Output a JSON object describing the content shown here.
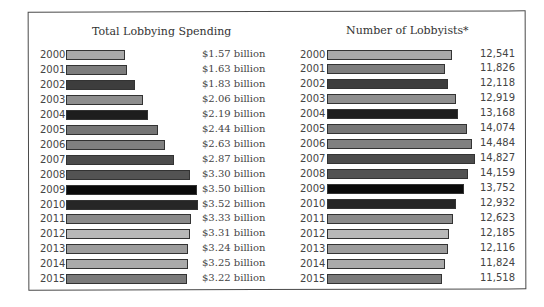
{
  "chart_data": [
    {
      "type": "bar",
      "orientation": "horizontal",
      "title": "Total Lobbying Spending",
      "categories": [
        "2000",
        "2001",
        "2002",
        "2003",
        "2004",
        "2005",
        "2006",
        "2007",
        "2008",
        "2009",
        "2010",
        "2011",
        "2012",
        "2013",
        "2014",
        "2015"
      ],
      "values": [
        1.57,
        1.63,
        1.83,
        2.06,
        2.19,
        2.44,
        2.63,
        2.87,
        3.3,
        3.5,
        3.52,
        3.33,
        3.31,
        3.24,
        3.25,
        3.22
      ],
      "labels": [
        "$1.57 billion",
        "$1.63 billion",
        "$1.83 billion",
        "$2.06 billion",
        "$2.19 billion",
        "$2.44 billion",
        "$2.63 billion",
        "$2.87 billion",
        "$3.30 billion",
        "$3.50 billion",
        "$3.52 billion",
        "$3.33 billion",
        "$3.31 billion",
        "$3.24 billion",
        "$3.25 billion",
        "$3.22 billion"
      ],
      "unit": "billion USD",
      "xlabel": "",
      "ylabel": "",
      "grid": false
    },
    {
      "type": "bar",
      "orientation": "horizontal",
      "title": "Number of Lobbyists*",
      "categories": [
        "2000",
        "2001",
        "2002",
        "2003",
        "2004",
        "2005",
        "2006",
        "2007",
        "2008",
        "2009",
        "2010",
        "2011",
        "2012",
        "2013",
        "2014",
        "2015"
      ],
      "values": [
        12541,
        11826,
        12118,
        12919,
        13168,
        14074,
        14484,
        14827,
        14159,
        13752,
        12932,
        12623,
        12185,
        12116,
        11824,
        11518
      ],
      "labels": [
        "12,541",
        "11,826",
        "12,118",
        "12,919",
        "13,168",
        "14,074",
        "14,484",
        "14,827",
        "14,159",
        "13,752",
        "12,932",
        "12,623",
        "12,185",
        "12,116",
        "11,824",
        "11,518"
      ],
      "xlabel": "",
      "ylabel": "",
      "grid": false
    }
  ],
  "bar_colors": [
    "#a8a8a8",
    "#7d7d7d",
    "#3d3d3d",
    "#8e8e8e",
    "#1e1e1e",
    "#767676",
    "#808080",
    "#4c4c4c",
    "#535353",
    "#0a0a0a",
    "#262626",
    "#8a8a8a",
    "#b8b8b8",
    "#9c9c9c",
    "#aaaaaa",
    "#7a7a7a"
  ]
}
